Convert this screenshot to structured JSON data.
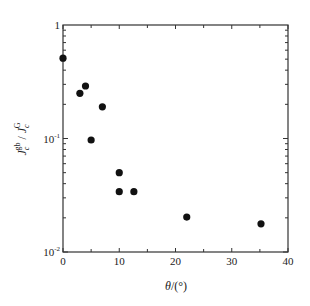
{
  "chart_data": {
    "type": "scatter",
    "title": "",
    "xlabel": "θ/(°)",
    "ylabel": "J_c^gb / J_c^G",
    "xlim": [
      0,
      40
    ],
    "ylim": [
      0.01,
      1
    ],
    "yscale": "log",
    "x_ticks": [
      0,
      10,
      20,
      30,
      40
    ],
    "x_tick_labels": [
      "0",
      "10",
      "20",
      "30",
      "40"
    ],
    "x_minor_ticks": [
      5,
      15,
      25,
      35
    ],
    "y_ticks": [
      0.01,
      0.1,
      1
    ],
    "y_tick_labels": [
      {
        "base": "10",
        "exp": "-2"
      },
      {
        "base": "10",
        "exp": "-1"
      },
      {
        "base": "1",
        "exp": ""
      }
    ],
    "grid": false,
    "legend": null,
    "marker": "filled-circle",
    "marker_color": "#111111",
    "series": [
      {
        "name": "data",
        "points": [
          {
            "x": 0.0,
            "y": 0.51
          },
          {
            "x": 3.0,
            "y": 0.25
          },
          {
            "x": 4.0,
            "y": 0.29
          },
          {
            "x": 5.0,
            "y": 0.097
          },
          {
            "x": 7.0,
            "y": 0.19
          },
          {
            "x": 10.0,
            "y": 0.05
          },
          {
            "x": 10.0,
            "y": 0.034
          },
          {
            "x": 12.6,
            "y": 0.034
          },
          {
            "x": 22.0,
            "y": 0.0203
          },
          {
            "x": 35.2,
            "y": 0.0177
          }
        ]
      }
    ]
  },
  "labels": {
    "xlabel_theta": "θ",
    "xlabel_unit": "/(°)",
    "ylabel_J1": "J",
    "ylabel_sub1": "c",
    "ylabel_sup1": "gb",
    "ylabel_sep": " / ",
    "ylabel_J2": "J",
    "ylabel_sub2": "c",
    "ylabel_sup2": "G"
  }
}
